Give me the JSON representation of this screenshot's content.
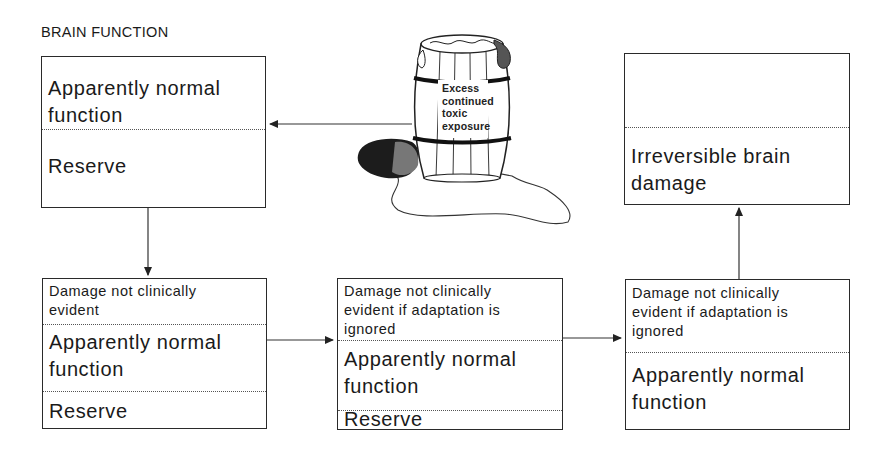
{
  "title": "BRAIN FUNCTION",
  "barrel": {
    "label_lines": [
      "Excess",
      "continued",
      "toxic",
      "exposure"
    ]
  },
  "boxes": {
    "initial": {
      "normal_line1": "Apparently normal",
      "normal_line2": "function",
      "reserve": "Reserve"
    },
    "stage1": {
      "damage_line1": "Damage not clinically",
      "damage_line2": "evident",
      "normal_line1": "Apparently normal",
      "normal_line2": "function",
      "reserve": "Reserve"
    },
    "stage2": {
      "damage_line1": "Damage not clinically",
      "damage_line2": "evident if adaptation is",
      "damage_line3": "ignored",
      "normal_line1": "Apparently normal",
      "normal_line2": "function",
      "reserve": "Reserve"
    },
    "stage3": {
      "damage_line1": "Damage not clinically",
      "damage_line2": "evident if adaptation is",
      "damage_line3": "ignored",
      "normal_line1": "Apparently normal",
      "normal_line2": "function"
    },
    "final": {
      "damage_line1": "Irreversible brain",
      "damage_line2": "damage"
    }
  },
  "colors": {
    "line": "#2a2a2a",
    "text": "#1a1a1a",
    "background": "#ffffff"
  }
}
